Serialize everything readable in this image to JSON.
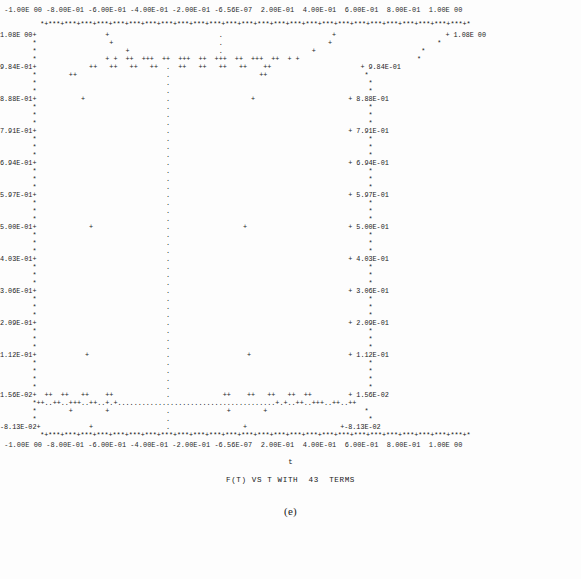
{
  "figure": {
    "label": "(e)",
    "title": "F(T) VS T WITH  43  TERMS",
    "xaxis_name": "t",
    "top_crumb": "",
    "terms": 43
  },
  "axes": {
    "x_tick_labels": [
      "-1.00E 00",
      "-8.00E-01",
      "-6.00E-01",
      "-4.00E-01",
      "-2.00E-01",
      "-6.56E-07",
      "2.00E-01",
      "4.00E-01",
      "6.00E-01",
      "8.00E-01",
      "1.00E 00"
    ],
    "x_tick_row_top": " -1.00E 00 -8.00E-01 -6.00E-01 -4.00E-01 -2.00E-01 -6.56E-07  2.00E-01  4.00E-01  6.00E-01  8.00E-01  1.00E 00",
    "x_tick_row_bottom": " -1.00E 00 -8.00E-01 -6.00E-01 -4.00E-01 -2.00E-01 -6.56E-07  2.00E-01  4.00E-01  6.00E-01  8.00E-01  1.00E 00",
    "y_tick_labels": [
      "1.08E 00",
      "9.84E-01",
      "8.88E-01",
      "7.91E-01",
      "6.94E-01",
      "5.97E-01",
      "5.00E-01",
      "4.03E-01",
      "3.06E-01",
      "2.09E-01",
      "1.12E-01",
      "1.56E-02",
      "-8.13E-02"
    ],
    "y_left_labels": [
      "1.08E 00+",
      "9.84E-01+",
      "8.88E-01+",
      "7.91E-01+",
      "6.94E-01+",
      "5.97E-01+",
      "5.00E-01+",
      "4.03E-01+",
      "3.06E-01+",
      "2.09E-01+",
      "1.12E-01+",
      "1.56E-02+",
      "-8.13E-02+"
    ],
    "y_right_labels": [
      "+ 1.08E 00",
      "+ 9.84E-01",
      "+ 8.88E-01",
      "+ 7.91E-01",
      "+ 6.94E-01",
      "+ 5.97E-01",
      "+ 5.00E-01",
      "+ 4.03E-01",
      "+ 3.06E-01",
      "+ 2.09E-01",
      "+ 1.12E-01",
      "+ 1.56E-02",
      "+-8.13E-02"
    ],
    "xlim": [
      -1.0,
      1.0
    ],
    "ylim": [
      -0.0813,
      1.08
    ],
    "border_glyph": "*",
    "tick_glyph": "+",
    "grid_glyph": ".",
    "data_glyph": "+"
  },
  "chart_data": {
    "type": "line",
    "title": "F(T) VS T WITH  43  TERMS",
    "xlabel": "t",
    "ylabel": "",
    "xlim": [
      -1.0,
      1.0
    ],
    "ylim": [
      -0.0813,
      1.08
    ],
    "grid": true,
    "legend": "none",
    "x_ticks": [
      -1.0,
      -0.8,
      -0.6,
      -0.4,
      -0.2,
      -6.56e-07,
      0.2,
      0.4,
      0.6,
      0.8,
      1.0
    ],
    "y_ticks": [
      1.08,
      0.984,
      0.888,
      0.791,
      0.694,
      0.597,
      0.5,
      0.403,
      0.306,
      0.209,
      0.112,
      0.0156,
      -0.0813
    ],
    "series": [
      {
        "name": "F(T)",
        "marker": "+",
        "x": [
          -1.0,
          -0.96,
          -0.92,
          -0.88,
          -0.84,
          -0.8,
          -0.76,
          -0.72,
          -0.68,
          -0.64,
          -0.6,
          -0.56,
          -0.52,
          -0.48,
          -0.44,
          -0.4,
          -0.36,
          -0.32,
          -0.28,
          -0.24,
          -0.2,
          -0.16,
          -0.12,
          -0.08,
          -0.04,
          0.0,
          0.04,
          0.08,
          0.12,
          0.16,
          0.2,
          0.24,
          0.28,
          0.32,
          0.36,
          0.4,
          0.44,
          0.48,
          0.52,
          0.56,
          0.6,
          0.64,
          0.68,
          0.72,
          0.76,
          0.8,
          0.84,
          0.88,
          0.92,
          0.96,
          1.0
        ],
        "y": [
          0.0,
          -0.06,
          0.04,
          0.02,
          0.0,
          0.02,
          0.0,
          0.02,
          0.0,
          0.03,
          0.0,
          0.02,
          0.0,
          0.03,
          0.01,
          0.02,
          0.0,
          0.03,
          0.0,
          -0.05,
          0.11,
          0.5,
          0.89,
          1.02,
          1.08,
          1.0,
          1.08,
          1.02,
          0.89,
          0.5,
          0.11,
          -0.05,
          0.0,
          0.03,
          0.0,
          0.02,
          0.01,
          0.03,
          0.0,
          0.02,
          0.0,
          0.03,
          0.0,
          0.02,
          0.0,
          0.02,
          0.0,
          0.02,
          0.04,
          -0.06,
          0.0
        ]
      }
    ],
    "gibbs_overshoot": 1.08,
    "gibbs_undershoot": -0.0813
  },
  "canvas": {
    "rows": [
      {
        "y": 20,
        "kind": "border",
        "text": "          *+***+***+***+***+***+***+***+***+***+***+***+***+***+***+***+***+***+***+***+***+***+***+***+***+***+***+*"
      },
      {
        "y": 31,
        "kind": "data",
        "text": "1.08E 00+                 +                           .                           +                           + 1.08E 00"
      },
      {
        "y": 39,
        "kind": "data",
        "text": "        *                  +                          .                          +                          * "
      },
      {
        "y": 47,
        "kind": "data",
        "text": "        *                      +                      .                      +                          * "
      },
      {
        "y": 55,
        "kind": "data",
        "text": "        *                 + +  ++  +++  ++  +++  ++  +++  ++  +++  ++  + +                             * "
      },
      {
        "y": 63,
        "kind": "data",
        "text": "9.84E-01+             ++   ++   ++   ++  .  ++   ++   ++   ++    ++                      + 9.84E-01"
      },
      {
        "y": 71,
        "kind": "data",
        "text": "        *        ++                      .                      ++                        * "
      },
      {
        "y": 79,
        "kind": "data",
        "text": "        *                                .                                                 * "
      },
      {
        "y": 87,
        "kind": "data",
        "text": "        *                                .                                                 * "
      },
      {
        "y": 95,
        "kind": "data",
        "text": "8.88E-01+           +                    .                    +                       + 8.88E-01"
      },
      {
        "y": 103,
        "kind": "data",
        "text": "        *                                .                                                 * "
      },
      {
        "y": 111,
        "kind": "data",
        "text": "        *                                .                                                 * "
      },
      {
        "y": 119,
        "kind": "data",
        "text": "        *                                .                                                 * "
      },
      {
        "y": 127,
        "kind": "data",
        "text": "7.91E-01+                                .                                            + 7.91E-01"
      },
      {
        "y": 135,
        "kind": "data",
        "text": "        *                                .                                                 * "
      },
      {
        "y": 143,
        "kind": "data",
        "text": "        *                                .                                                 * "
      },
      {
        "y": 151,
        "kind": "data",
        "text": "        *                                .                                                 * "
      },
      {
        "y": 159,
        "kind": "data",
        "text": "6.94E-01+                                .                                            + 6.94E-01"
      },
      {
        "y": 167,
        "kind": "data",
        "text": "        *                                .                                                 * "
      },
      {
        "y": 175,
        "kind": "data",
        "text": "        *                                .                                                 * "
      },
      {
        "y": 183,
        "kind": "data",
        "text": "        *                                .                                                 * "
      },
      {
        "y": 191,
        "kind": "data",
        "text": "5.97E-01+                                .                                            + 5.97E-01"
      },
      {
        "y": 199,
        "kind": "data",
        "text": "        *                                .                                                 * "
      },
      {
        "y": 207,
        "kind": "data",
        "text": "        *                                .                                                 * "
      },
      {
        "y": 215,
        "kind": "data",
        "text": "        *                                .                                                 * "
      },
      {
        "y": 223,
        "kind": "data",
        "text": "5.00E-01+             +                  .                  +                         + 5.00E-01"
      },
      {
        "y": 231,
        "kind": "data",
        "text": "        *                                .                                                 * "
      },
      {
        "y": 239,
        "kind": "data",
        "text": "        *                                .                                                 * "
      },
      {
        "y": 247,
        "kind": "data",
        "text": "        *                                .                                                 * "
      },
      {
        "y": 255,
        "kind": "data",
        "text": "4.03E-01+                                .                                            + 4.03E-01"
      },
      {
        "y": 263,
        "kind": "data",
        "text": "        *                                .                                                 * "
      },
      {
        "y": 271,
        "kind": "data",
        "text": "        *                                .                                                 * "
      },
      {
        "y": 279,
        "kind": "data",
        "text": "        *                                .                                                 * "
      },
      {
        "y": 287,
        "kind": "data",
        "text": "3.06E-01+                                .                                            + 3.06E-01"
      },
      {
        "y": 295,
        "kind": "data",
        "text": "        *                                .                                                 * "
      },
      {
        "y": 303,
        "kind": "data",
        "text": "        *                                .                                                 * "
      },
      {
        "y": 311,
        "kind": "data",
        "text": "        *                                .                                                 * "
      },
      {
        "y": 319,
        "kind": "data",
        "text": "2.09E-01+                                .                                            + 2.09E-01"
      },
      {
        "y": 327,
        "kind": "data",
        "text": "        *                                .                                                 * "
      },
      {
        "y": 335,
        "kind": "data",
        "text": "        *                                .                                                 * "
      },
      {
        "y": 343,
        "kind": "data",
        "text": "        *                                .                                                 * "
      },
      {
        "y": 351,
        "kind": "data",
        "text": "1.12E-01+            +                   .                   +                        + 1.12E-01"
      },
      {
        "y": 359,
        "kind": "data",
        "text": "        *                                .                                                 * "
      },
      {
        "y": 367,
        "kind": "data",
        "text": "        *                                .                                                 * "
      },
      {
        "y": 375,
        "kind": "data",
        "text": "        *                                .                                                 * "
      },
      {
        "y": 383,
        "kind": "data",
        "text": "        *                                .                                                 * "
      },
      {
        "y": 391,
        "kind": "data",
        "text": "1.56E-02+  ++  ++   ++    ++             .             ++    ++   ++   ++  ++         + 1.56E-02"
      },
      {
        "y": 399,
        "kind": "grid",
        "text": "        *++..++..+++..++..+.+.......................................+.+..++..+++..++..++"
      },
      {
        "y": 407,
        "kind": "data",
        "text": "        *        +        +              .              +        +                        * "
      },
      {
        "y": 415,
        "kind": "data",
        "text": "        *                                .                                                 * "
      },
      {
        "y": 423,
        "kind": "data",
        "text": "-8.13E-02+            +                  .                  +                       +-8.13E-02"
      },
      {
        "y": 431,
        "kind": "border",
        "text": "          *+***+***+***+***+***+***+***+***+***+***+***+***+***+***+***+***+***+***+***+***+***+***+***+***+***+***+*"
      }
    ]
  }
}
